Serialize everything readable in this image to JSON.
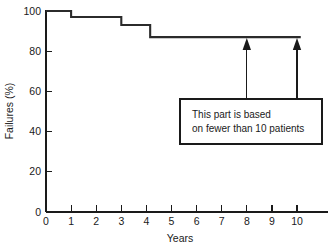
{
  "chart_data": {
    "type": "line",
    "subtype": "step",
    "title": "",
    "xlabel": "Years",
    "ylabel": "Failures (%)",
    "xlim": [
      0,
      11.2
    ],
    "ylim": [
      0,
      104
    ],
    "grid": false,
    "legend": null,
    "x_ticks": [
      0,
      1,
      2,
      3,
      4,
      5,
      6,
      7,
      8,
      9,
      10
    ],
    "x_tick_labels": [
      "0",
      "1",
      "2",
      "3",
      "4",
      "5",
      "6",
      "7",
      "8",
      "9",
      "10"
    ],
    "y_ticks": [
      0,
      20,
      40,
      60,
      80,
      100
    ],
    "y_tick_labels": [
      "0",
      "20",
      "40",
      "60",
      "80",
      "100"
    ],
    "series": [
      {
        "name": "Failures",
        "step": "post",
        "x": [
          0,
          1,
          1,
          3,
          3,
          4.15,
          4.15,
          10.15
        ],
        "y": [
          100,
          100,
          97,
          97,
          93,
          93,
          87,
          87
        ],
        "points": [
          {
            "x": 0,
            "y": 100
          },
          {
            "x": 1,
            "y": 97
          },
          {
            "x": 3,
            "y": 93
          },
          {
            "x": 4.15,
            "y": 87
          },
          {
            "x": 10.15,
            "y": 87
          }
        ]
      }
    ],
    "annotations": [
      {
        "type": "callout-box",
        "lines": [
          "This part is based",
          "on fewer than 10 patients"
        ],
        "arrows_to_x": [
          8,
          10
        ],
        "arrows_to_y": 87
      }
    ]
  },
  "axes": {
    "y_label": "Failures (%)",
    "x_label": "Years"
  },
  "callout": {
    "line1": "This part is based",
    "line2": "on fewer than 10 patients"
  },
  "colors": {
    "curve": "#2b2b2b",
    "axis": "#1a1a1a",
    "background": "#ffffff"
  }
}
